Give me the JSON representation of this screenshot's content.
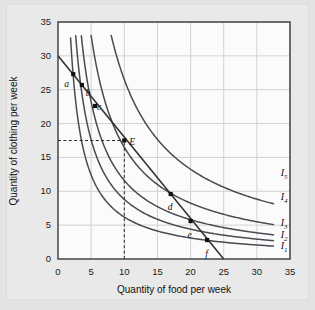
{
  "chart_data": {
    "type": "line",
    "title": "",
    "xlabel": "Quantity of food per week",
    "ylabel": "Quantity of clothing per week",
    "xlim": [
      0,
      35
    ],
    "ylim": [
      0,
      35
    ],
    "xticks": [
      0,
      5,
      10,
      15,
      20,
      25,
      30,
      35
    ],
    "yticks": [
      0,
      5,
      10,
      15,
      20,
      25,
      30,
      35
    ],
    "grid": true,
    "legend_position": "right-inline",
    "series": [
      {
        "name": "I1",
        "label": "I",
        "sub": "1",
        "kind": "indifference-curve",
        "k": 62,
        "x_start": 1.9,
        "x_end": 32.5,
        "label_x": 33.6,
        "label_y": 1.7
      },
      {
        "name": "I2",
        "label": "I",
        "sub": "2",
        "kind": "indifference-curve",
        "k": 88,
        "x_start": 2.67,
        "x_end": 32.5,
        "label_x": 33.6,
        "label_y": 3.4
      },
      {
        "name": "I3",
        "label": "I",
        "sub": "3",
        "kind": "indifference-curve",
        "k": 116,
        "x_start": 3.52,
        "x_end": 32.5,
        "label_x": 33.6,
        "label_y": 5.1
      },
      {
        "name": "I4",
        "label": "I",
        "sub": "4",
        "kind": "indifference-curve",
        "k": 165,
        "x_start": 5.0,
        "x_end": 32.5,
        "label_x": 33.6,
        "label_y": 9.0
      },
      {
        "name": "I5",
        "label": "I",
        "sub": "5",
        "kind": "indifference-curve",
        "k": 265,
        "x_start": 8.03,
        "x_end": 32.5,
        "label_x": 33.6,
        "label_y": 12.5
      }
    ],
    "budget_line": {
      "name": "budget-line",
      "x_intercept": 25,
      "y_intercept": 30,
      "slope": -1.2
    },
    "points": [
      {
        "id": "a",
        "label": "a",
        "x": 2.3,
        "y": 27.3,
        "label_dx": -9,
        "label_dy": 6
      },
      {
        "id": "b",
        "label": "b",
        "x": 3.6,
        "y": 25.7,
        "label_dx": 4,
        "label_dy": 4
      },
      {
        "id": "c",
        "label": "c",
        "x": 5.6,
        "y": 22.6,
        "label_dx": 2,
        "label_dy": -3
      },
      {
        "id": "E",
        "label": "E",
        "x": 10.0,
        "y": 17.5,
        "label_dx": 5,
        "label_dy": -3
      },
      {
        "id": "d",
        "label": "d",
        "x": 17.0,
        "y": 9.6,
        "label_dx": -3,
        "label_dy": 9
      },
      {
        "id": "e",
        "label": "e",
        "x": 20.0,
        "y": 5.6,
        "label_dx": -3,
        "label_dy": 10
      },
      {
        "id": "f",
        "label": "f",
        "x": 22.5,
        "y": 2.8,
        "label_dx": -2,
        "label_dy": 10
      }
    ],
    "guides": [
      {
        "name": "vertical-dashed-guide-E",
        "from": [
          10,
          0
        ],
        "to": [
          10,
          17.5
        ]
      },
      {
        "name": "horizontal-dashed-guide-E",
        "from": [
          0,
          17.5
        ],
        "to": [
          10,
          17.5
        ]
      }
    ],
    "colors": {
      "figure_background": "#e3e3e3",
      "panel_background": "#fbfbfb",
      "gridline": "#d2d2d2",
      "axis": "#3a3a3a",
      "curve": "#4a4a52",
      "budget_line": "#333333",
      "point_marker": "#111111",
      "text": "#111111"
    }
  }
}
